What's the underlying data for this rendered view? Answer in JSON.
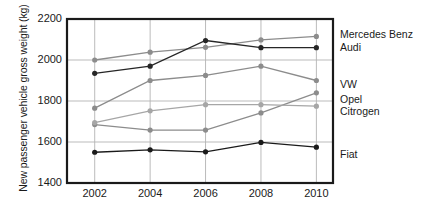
{
  "chart_data": {
    "type": "line",
    "title": "",
    "xlabel": "",
    "ylabel": "New passenger vehicle gross weight (kg)",
    "x": [
      2002,
      2004,
      2006,
      2008,
      2010
    ],
    "xticklabels": [
      "2002",
      "2004",
      "2006",
      "2008",
      "2010"
    ],
    "yticklabels": [
      "1400",
      "1600",
      "1800",
      "2000",
      "2200"
    ],
    "yticks": [
      1400,
      1600,
      1800,
      2000,
      2200
    ],
    "ylim": [
      1400,
      2200
    ],
    "xlim": [
      2001,
      2010.6
    ],
    "grid": true,
    "legend_position": "right-of-axes",
    "series": [
      {
        "name": "Mercedes Benz",
        "color": "#8c8c8c",
        "label_y": 35,
        "values": [
          2000,
          2038,
          2062,
          2098,
          2115
        ]
      },
      {
        "name": "Audi",
        "color": "#262626",
        "label_y": 48,
        "values": [
          1935,
          1970,
          2095,
          2060,
          2060
        ]
      },
      {
        "name": "VW",
        "color": "#8c8c8c",
        "label_y": 85,
        "values": [
          1765,
          1900,
          1925,
          1970,
          1900
        ]
      },
      {
        "name": "Opel",
        "color": "#8c8c8c",
        "label_y": 100,
        "values": [
          1685,
          1658,
          1658,
          1742,
          1840
        ]
      },
      {
        "name": "Citrogen",
        "color": "#a6a6a6",
        "label_y": 112,
        "values": [
          1695,
          1752,
          1782,
          1782,
          1775
        ]
      },
      {
        "name": "Fiat",
        "color": "#1a1a1a",
        "label_y": 155,
        "values": [
          1550,
          1562,
          1552,
          1598,
          1575
        ]
      }
    ]
  },
  "axes": {
    "frame_color": "#1a1a1a",
    "grid_color": "#b3b3b3"
  }
}
